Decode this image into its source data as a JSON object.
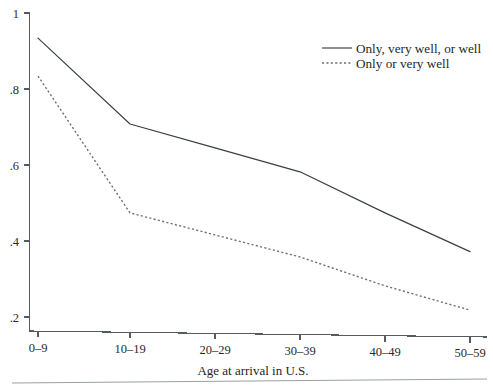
{
  "chart_data": {
    "type": "line",
    "title": "",
    "xlabel": "Age at arrival in U.S.",
    "ylabel": "",
    "categories": [
      "0–9",
      "10–19",
      "20–29",
      "30–39",
      "40–49",
      "50–59"
    ],
    "ylim": [
      0.2,
      1
    ],
    "yticks": [
      1,
      0.8,
      0.6,
      0.4,
      0.2
    ],
    "ytick_labels": [
      "1",
      ".8",
      ".6",
      ".4",
      ".2"
    ],
    "grid": false,
    "legend_position": "top-right",
    "series": [
      {
        "name": "Only, very well, or well",
        "style": "solid",
        "color": "#3a3f42",
        "values": [
          0.934,
          0.708,
          0.645,
          0.582,
          0.474,
          0.372
        ]
      },
      {
        "name": "Only or very well",
        "style": "dotted",
        "color": "#6a6f72",
        "values": [
          0.834,
          0.474,
          0.416,
          0.358,
          0.282,
          0.218
        ]
      }
    ]
  },
  "axes": {
    "x_tick_labels": [
      "0–9",
      "10–19",
      "20–29",
      "30–39",
      "40–49",
      "50–59"
    ],
    "y_tick_labels": [
      "1",
      ".8",
      ".6",
      ".4",
      ".2"
    ],
    "x_axis_title": "Age at arrival in U.S."
  },
  "legend": {
    "items": [
      {
        "label": "Only, very well, or well",
        "style": "solid"
      },
      {
        "label": "Only or very well",
        "style": "dotted"
      }
    ]
  }
}
